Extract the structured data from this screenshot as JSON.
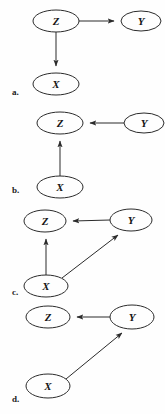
{
  "figure": {
    "background_color": "#fefefe",
    "stroke_color": "#2b2b2b",
    "width": 165,
    "height": 414
  },
  "panels": [
    {
      "id": "a",
      "label": "a.",
      "label_x": 12,
      "label_y": 88,
      "nodes": [
        {
          "id": "a-z",
          "name": "Z",
          "cx": 56,
          "cy": 21,
          "rx": 23,
          "ry": 11
        },
        {
          "id": "a-y",
          "name": "Y",
          "cx": 141,
          "cy": 21,
          "rx": 20,
          "ry": 10
        },
        {
          "id": "a-x",
          "name": "X",
          "cx": 56,
          "cy": 84,
          "rx": 23,
          "ry": 11
        }
      ],
      "edges": [
        {
          "id": "a-z-to-y",
          "from": "Z",
          "to": "Y",
          "label": "Z to Y"
        },
        {
          "id": "a-z-to-x",
          "from": "Z",
          "to": "X",
          "label": "Z to X"
        }
      ]
    },
    {
      "id": "b",
      "label": "b.",
      "label_x": 12,
      "label_y": 186,
      "nodes": [
        {
          "id": "b-z",
          "name": "Z",
          "cx": 60,
          "cy": 123,
          "rx": 23,
          "ry": 11
        },
        {
          "id": "b-y",
          "name": "Y",
          "cx": 144,
          "cy": 123,
          "rx": 20,
          "ry": 10
        },
        {
          "id": "b-x",
          "name": "X",
          "cx": 60,
          "cy": 187,
          "rx": 23,
          "ry": 11
        }
      ],
      "edges": [
        {
          "id": "b-y-to-z",
          "from": "Y",
          "to": "Z",
          "label": "Y to Z"
        },
        {
          "id": "b-x-to-z",
          "from": "X",
          "to": "Z",
          "label": "X to Z"
        }
      ]
    },
    {
      "id": "c",
      "label": "c.",
      "label_x": 12,
      "label_y": 288,
      "nodes": [
        {
          "id": "c-z",
          "name": "Z",
          "cx": 45,
          "cy": 221,
          "rx": 21,
          "ry": 11
        },
        {
          "id": "c-y",
          "name": "Y",
          "cx": 131,
          "cy": 220,
          "rx": 21,
          "ry": 11
        },
        {
          "id": "c-x",
          "name": "X",
          "cx": 46,
          "cy": 286,
          "rx": 22,
          "ry": 11
        }
      ],
      "edges": [
        {
          "id": "c-y-to-z",
          "from": "Y",
          "to": "Z",
          "label": "Y to Z"
        },
        {
          "id": "c-x-to-z",
          "from": "X",
          "to": "Z",
          "label": "X to Z"
        },
        {
          "id": "c-x-to-y",
          "from": "X",
          "to": "Y",
          "label": "X to Y"
        }
      ]
    },
    {
      "id": "d",
      "label": "d.",
      "label_x": 12,
      "label_y": 395,
      "nodes": [
        {
          "id": "d-z",
          "name": "Z",
          "cx": 48,
          "cy": 317,
          "rx": 22,
          "ry": 11
        },
        {
          "id": "d-y",
          "name": "Y",
          "cx": 132,
          "cy": 317,
          "rx": 22,
          "ry": 12
        },
        {
          "id": "d-x",
          "name": "X",
          "cx": 48,
          "cy": 386,
          "rx": 22,
          "ry": 12
        }
      ],
      "edges": [
        {
          "id": "d-y-to-z",
          "from": "Y",
          "to": "Z",
          "label": "Y to Z"
        },
        {
          "id": "d-x-to-y",
          "from": "X",
          "to": "Y",
          "label": "X to Y"
        }
      ]
    }
  ]
}
